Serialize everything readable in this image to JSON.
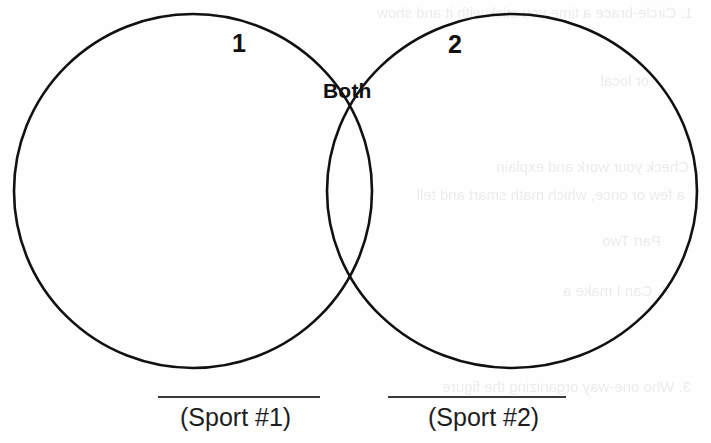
{
  "worksheet": {
    "diagram_type": "venn-diagram",
    "region_labels": {
      "left_only": "1",
      "right_only": "2",
      "intersection": "Both"
    },
    "answer_lines": [
      {
        "caption": "(Sport #1)",
        "value": ""
      },
      {
        "caption": "(Sport #2)",
        "value": ""
      }
    ],
    "colors": {
      "stroke": "#111111",
      "rule": "#3a3a3a",
      "paper": "#fefefe",
      "text": "#111111"
    },
    "bleed_through": {
      "lines": [
        "1. Circle-brace a time you stick with it and show",
        "or                  local",
        "Check your work and explain",
        "a few or once, which math smart and tell",
        "Part Two",
        "4. Can I make a",
        "3. Who one-way organizing the figure"
      ]
    }
  }
}
